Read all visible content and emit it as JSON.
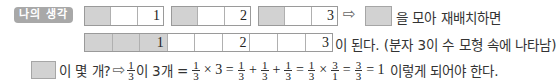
{
  "badge": {
    "label": "나의 생각",
    "color": "#a8a8a8"
  },
  "row1": {
    "bars": [
      {
        "cells": [
          {
            "shaded": true,
            "num": ""
          },
          {
            "shaded": false,
            "num": ""
          },
          {
            "shaded": false,
            "num": "1"
          }
        ]
      },
      {
        "cells": [
          {
            "shaded": true,
            "num": ""
          },
          {
            "shaded": false,
            "num": ""
          },
          {
            "shaded": false,
            "num": "2"
          }
        ]
      },
      {
        "cells": [
          {
            "shaded": true,
            "num": ""
          },
          {
            "shaded": false,
            "num": ""
          },
          {
            "shaded": false,
            "num": "3"
          }
        ]
      }
    ],
    "arrow": "⇨",
    "text": "을 모아 재배치하면"
  },
  "row2": {
    "cells": [
      {
        "shaded": true,
        "num": ""
      },
      {
        "shaded": true,
        "num": ""
      },
      {
        "shaded": true,
        "num": "1"
      },
      {
        "shaded": false,
        "num": ""
      },
      {
        "shaded": false,
        "num": ""
      },
      {
        "shaded": false,
        "num": "2"
      },
      {
        "shaded": false,
        "num": ""
      },
      {
        "shaded": false,
        "num": ""
      },
      {
        "shaded": false,
        "num": "3"
      }
    ],
    "text": "이 된다. (분자 3이 수 모형 속에 나타남)"
  },
  "row3": {
    "text_a": "이 몇 개?",
    "arrow": "⇨",
    "f1_n": "1",
    "f1_d": "3",
    "text_b": "이 3개 =",
    "f2_n": "1",
    "f2_d": "3",
    "times1": "× 3 =",
    "f3_n": "1",
    "f3_d": "3",
    "plus1": "+",
    "f4_n": "1",
    "f4_d": "3",
    "plus2": "+",
    "f5_n": "1",
    "f5_d": "3",
    "eq1": "=",
    "f6_n": "1",
    "f6_d": "3",
    "times2": "×",
    "f7_n": "3",
    "f7_d": "1",
    "eq2": "=",
    "f8_n": "3",
    "f8_d": "3",
    "eq3": "= 1",
    "text_c": "이렇게 되어야 한다."
  },
  "colors": {
    "shaded_cell": "#d2d2d2",
    "border": "#9a9a9a"
  }
}
